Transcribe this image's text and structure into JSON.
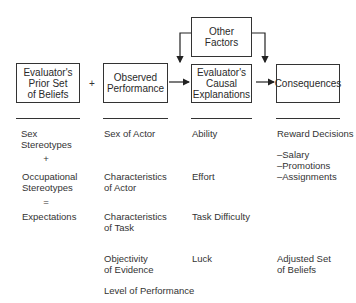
{
  "diagram": {
    "boxes": {
      "prior_beliefs": "Evaluator's\nPrior Set\nof Beliefs",
      "observed_performance": "Observed\nPerformance",
      "other_factors": "Other\nFactors",
      "causal_explanations": "Evaluator's\nCausal\nExplanations",
      "consequences": "Consequences"
    },
    "plus_symbol": "+",
    "columns": {
      "prior_beliefs": {
        "items": [
          "Sex\nStereotypes",
          "+",
          "Occupational\nStereotypes",
          "=",
          "Expectations"
        ]
      },
      "observed_performance": {
        "items": [
          "Sex of Actor",
          "Characteristics\nof Actor",
          "Characteristics\nof Task",
          "Objectivity\nof Evidence",
          "Level of Performance"
        ]
      },
      "causal_explanations": {
        "items": [
          "Ability",
          "Effort",
          "Task Difficulty",
          "Luck"
        ]
      },
      "consequences": {
        "items": [
          "Reward Decisions",
          "–Salary\n–Promotions\n–Assignments",
          "Adjusted Set\nof Beliefs"
        ]
      }
    }
  }
}
